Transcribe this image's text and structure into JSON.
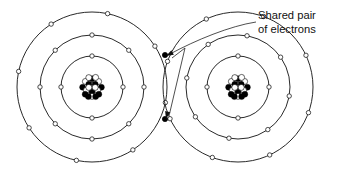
{
  "figure": {
    "title_alt": "Bohr model diagram of a covalent bond between two atoms",
    "background_color": "#ffffff",
    "line_color": "#111111",
    "width": 347,
    "height": 169
  },
  "callout": {
    "line1": "Shared pair",
    "line2": "of electrons",
    "text_x": 258,
    "text_y": 19,
    "line_height": 13.5
  },
  "atoms": [
    {
      "name": "left-atom",
      "cx": 92,
      "cy": 87,
      "nucleus_radius": 13,
      "shells": [
        {
          "name": "inner-shell",
          "radius": 31,
          "electron_count": 4,
          "start_angle": -90
        },
        {
          "name": "middle-shell",
          "radius": 52,
          "electron_count": 8,
          "start_angle": -90
        },
        {
          "name": "outer-shell",
          "radius": 75,
          "electron_count": 8,
          "start_angle": -78
        }
      ]
    },
    {
      "name": "right-atom",
      "cx": 238,
      "cy": 87,
      "nucleus_radius": 13,
      "shells": [
        {
          "name": "inner-shell",
          "radius": 31,
          "electron_count": 4,
          "start_angle": -90
        },
        {
          "name": "middle-shell",
          "radius": 52,
          "electron_count": 8,
          "start_angle": -80
        },
        {
          "name": "outer-shell",
          "radius": 75,
          "electron_count": 8,
          "start_angle": -70
        }
      ]
    }
  ],
  "shared_electrons": [
    {
      "name": "shared-electron-upper",
      "x": 165,
      "y": 55,
      "radius": 2.6
    },
    {
      "name": "shared-electron-lower",
      "x": 165,
      "y": 119,
      "radius": 2.6
    }
  ],
  "leaders": [
    {
      "name": "leader-to-upper-shared-electron",
      "path": "M 256 22 C 230 26, 196 40, 170 54",
      "arrow_tip": [
        166,
        56
      ],
      "arrow_angle": 152
    },
    {
      "name": "leader-to-lower-shared-electron",
      "path": "M 185 48 L 169 116",
      "arrow_tip": [
        166,
        119
      ],
      "arrow_angle": 103
    },
    {
      "name": "leader-spur",
      "path": "M 185 48 L 172 58"
    }
  ],
  "nucleus_pattern": {
    "description": "cluster of alternating filled and open nucleons",
    "proton_color": "#000000",
    "neutron_color": "#ffffff",
    "nucleon_radius": 3.0,
    "nucleons": [
      [
        0.0,
        -0.78,
        "p"
      ],
      [
        0.62,
        -0.52,
        "n"
      ],
      [
        -0.62,
        -0.52,
        "n"
      ],
      [
        -0.3,
        -0.88,
        "n"
      ],
      [
        0.34,
        -0.9,
        "n"
      ],
      [
        0.88,
        0.02,
        "p"
      ],
      [
        -0.88,
        0.02,
        "p"
      ],
      [
        0.0,
        -0.16,
        "n"
      ],
      [
        0.52,
        0.3,
        "n"
      ],
      [
        -0.52,
        0.3,
        "n"
      ],
      [
        0.0,
        0.44,
        "p"
      ],
      [
        0.3,
        -0.26,
        "p"
      ],
      [
        -0.3,
        -0.26,
        "p"
      ],
      [
        0.64,
        0.68,
        "p"
      ],
      [
        -0.64,
        0.68,
        "p"
      ],
      [
        0.0,
        0.88,
        "n"
      ],
      [
        0.3,
        0.04,
        "n"
      ],
      [
        -0.3,
        0.04,
        "n"
      ],
      [
        0.34,
        0.9,
        "p"
      ],
      [
        -0.34,
        0.9,
        "p"
      ]
    ]
  }
}
